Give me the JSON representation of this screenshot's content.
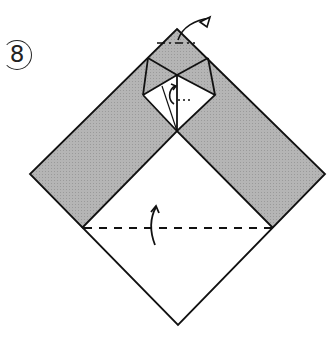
{
  "step": {
    "number": "8"
  },
  "colors": {
    "paper_back": "#b3b3b3",
    "paper_front": "#ffffff",
    "line": "#111111"
  },
  "diagram": {
    "shape": "diamond",
    "folds": [
      {
        "name": "valley-fold-bottom",
        "type": "valley",
        "style": "dashed",
        "direction": "up"
      },
      {
        "name": "mountain-fold-top",
        "type": "mountain",
        "style": "dash-dot",
        "direction": "back"
      }
    ],
    "arrows": [
      {
        "name": "fold-up-arrow",
        "position": "center-bottom"
      },
      {
        "name": "fold-back-arrow",
        "position": "top-right"
      },
      {
        "name": "inner-fold-arrow",
        "position": "top-center"
      }
    ]
  }
}
